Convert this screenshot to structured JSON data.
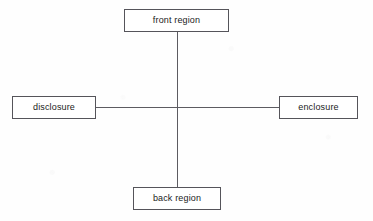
{
  "diagram": {
    "background_color": "#fefefe",
    "line_color": "#5c5b61",
    "border_color": "#55545a",
    "text_color": "#1b1b1b",
    "nodes": [
      {
        "id": "front-region",
        "label": "front region",
        "position": "top",
        "x": 124,
        "y": 9,
        "width": 105,
        "height": 23
      },
      {
        "id": "disclosure",
        "label": "disclosure",
        "position": "left",
        "x": 12,
        "y": 96,
        "width": 84,
        "height": 23
      },
      {
        "id": "enclosure",
        "label": "enclosure",
        "position": "right",
        "x": 279,
        "y": 96,
        "width": 79,
        "height": 23
      },
      {
        "id": "back-region",
        "label": "back region",
        "position": "bottom",
        "x": 133,
        "y": 187,
        "width": 88,
        "height": 23
      }
    ],
    "edges": [
      {
        "id": "vertical-axis",
        "from": "front-region",
        "to": "back-region",
        "orientation": "vertical"
      },
      {
        "id": "horizontal-axis",
        "from": "disclosure",
        "to": "enclosure",
        "orientation": "horizontal"
      }
    ],
    "intersection": {
      "x": 177,
      "y": 107
    }
  }
}
